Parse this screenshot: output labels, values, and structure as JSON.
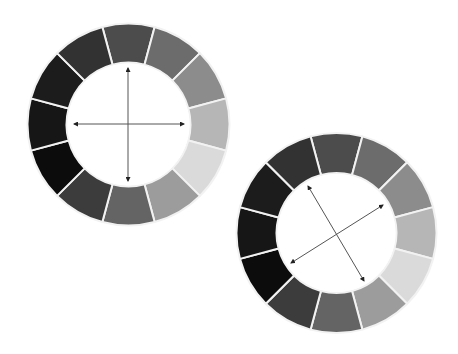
{
  "canvas": {
    "width": 458,
    "height": 354,
    "background": "#ffffff"
  },
  "separator_color": "#f2f2f2",
  "separator_width": 2,
  "arrow_color": "#555555",
  "arrowhead_color": "#222222",
  "segment_colors_clockwise_from_top": [
    "#4c4c4c",
    "#6c6c6c",
    "#8c8c8c",
    "#b6b6b6",
    "#dadada",
    "#9c9c9c",
    "#646464",
    "#3c3c3c",
    "#0c0c0c",
    "#161616",
    "#1c1c1c",
    "#323232"
  ],
  "wheels": [
    {
      "name": "color-wheel-upright",
      "cx": 128.5,
      "cy": 124.5,
      "outer_r": 101,
      "inner_r": 62,
      "arrows": [
        {
          "name": "vertical-axis-arrow",
          "x1": 128,
          "y1": 68,
          "x2": 128,
          "y2": 181
        },
        {
          "name": "horizontal-axis-arrow",
          "x1": 74,
          "y1": 124,
          "x2": 184,
          "y2": 124
        }
      ]
    },
    {
      "name": "color-wheel-rotated-axes",
      "cx": 336.5,
      "cy": 233,
      "outer_r": 100,
      "inner_r": 60,
      "arrows": [
        {
          "name": "diagonal-axis-arrow-a",
          "x1": 308,
          "y1": 186,
          "x2": 364,
          "y2": 281
        },
        {
          "name": "diagonal-axis-arrow-b",
          "x1": 291,
          "y1": 263,
          "x2": 383,
          "y2": 205
        }
      ]
    }
  ]
}
